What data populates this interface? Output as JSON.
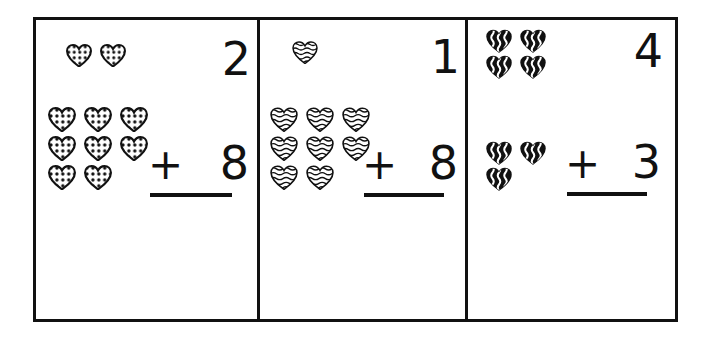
{
  "worksheet": {
    "title": "Heart Counting Addition Worksheet",
    "ink_color": "#111111",
    "paper_color": "#ffffff",
    "panel_count": 3
  },
  "panels": [
    {
      "id": "panel-1",
      "heart_style": "polka-dot",
      "heart_fill": "#ffffff",
      "heart_outline": "#111111",
      "heart_pattern_color": "#111111",
      "top_group": {
        "count": 2,
        "rows": [
          2
        ],
        "label": "2"
      },
      "bottom_group": {
        "count": 8,
        "rows": [
          3,
          3,
          2
        ],
        "label": "8"
      },
      "equation": {
        "addend_top": "2",
        "operator": "+",
        "addend_bottom": "8",
        "sum": "",
        "sum_blank": true
      }
    },
    {
      "id": "panel-2",
      "heart_style": "wavy-lines",
      "heart_fill": "#ffffff",
      "heart_outline": "#111111",
      "heart_pattern_color": "#111111",
      "top_group": {
        "count": 1,
        "rows": [
          1
        ],
        "label": "1"
      },
      "bottom_group": {
        "count": 8,
        "rows": [
          3,
          3,
          2
        ],
        "label": "8"
      },
      "equation": {
        "addend_top": "1",
        "operator": "+",
        "addend_bottom": "8",
        "sum": "",
        "sum_blank": true
      }
    },
    {
      "id": "panel-3",
      "heart_style": "zigzag-solid",
      "heart_fill": "#111111",
      "heart_outline": "#111111",
      "heart_pattern_color": "#ffffff",
      "top_group": {
        "count": 4,
        "rows": [
          2,
          2
        ],
        "label": "4"
      },
      "bottom_group": {
        "count": 3,
        "rows": [
          2,
          1
        ],
        "label": "3"
      },
      "equation": {
        "addend_top": "4",
        "operator": "+",
        "addend_bottom": "3",
        "sum": "",
        "sum_blank": true
      }
    }
  ]
}
